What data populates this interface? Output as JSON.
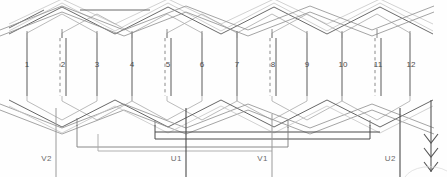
{
  "diagram": {
    "type": "winding-schematic",
    "slot_count": 12,
    "slot_labels": [
      "1",
      "2",
      "3",
      "4",
      "5",
      "6",
      "7",
      "8",
      "9",
      "10",
      "11",
      "12"
    ],
    "slot_x": [
      27,
      62,
      97,
      132,
      167,
      202,
      237,
      272,
      307,
      342,
      377,
      410
    ],
    "slot_label_y": 64,
    "double_layer_slots": [
      2,
      5,
      8,
      11
    ],
    "terminals": [
      {
        "label": "V2",
        "x": 52,
        "line_x": 56,
        "label_y": 158,
        "top_y": 108,
        "bottom_y": 177,
        "color": "#9a9a9a"
      },
      {
        "label": "U1",
        "x": 182,
        "line_x": 186,
        "label_y": 158,
        "top_y": 108,
        "bottom_y": 177,
        "color": "#4a4a4a"
      },
      {
        "label": "V1",
        "x": 268,
        "line_x": 272,
        "label_y": 158,
        "top_y": 114,
        "bottom_y": 177,
        "color": "#9a9a9a"
      },
      {
        "label": "U2",
        "x": 396,
        "line_x": 400,
        "label_y": 158,
        "top_y": 108,
        "bottom_y": 177,
        "color": "#4a4a4a"
      }
    ],
    "arrow": {
      "name": "rotation-direction-arrow",
      "x": 431,
      "top_y": 100,
      "bottom_y": 172,
      "chevrons": 3,
      "color": "#555555"
    },
    "colors": {
      "dark_wire": "#4a4a4a",
      "mid_wire": "#6f6f6f",
      "light_wire": "#a8a8a8",
      "faint_wire": "#c2c2c2",
      "background": "#fefefe",
      "label_text": "#4a4a4a",
      "terminal_text": "#6a6a6a"
    },
    "geometry": {
      "coil_top_y": 38,
      "coil_bottom_y": 96,
      "top_end_winding_y": 6,
      "bottom_end_winding_y": 130,
      "pitch": 35
    }
  }
}
